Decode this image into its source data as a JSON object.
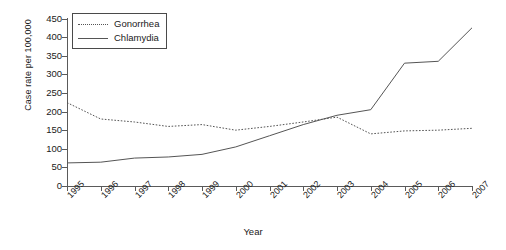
{
  "chart_data": {
    "type": "line",
    "title": "",
    "xlabel": "Year",
    "ylabel": "Case rate per 100,000",
    "x": [
      1995,
      1996,
      1997,
      1998,
      1999,
      2000,
      2001,
      2002,
      2003,
      2004,
      2005,
      2006,
      2007
    ],
    "categories": [
      "1995",
      "1996",
      "1997",
      "1998",
      "1999",
      "2000",
      "2001",
      "2002",
      "2003",
      "2004",
      "2005",
      "2006",
      "2007"
    ],
    "xlim": [
      1995,
      2007
    ],
    "ylim": [
      0,
      450
    ],
    "yticks": [
      0,
      50,
      100,
      150,
      200,
      250,
      300,
      350,
      400,
      450
    ],
    "grid": false,
    "legend_position": "top-left",
    "series": [
      {
        "name": "Gonorrhea",
        "style": "dotted",
        "color": "#555555",
        "values": [
          224,
          180,
          172,
          160,
          165,
          150,
          160,
          172,
          185,
          140,
          148,
          150,
          155
        ]
      },
      {
        "name": "Chlamydia",
        "style": "solid",
        "color": "#555555",
        "values": [
          62,
          64,
          75,
          78,
          85,
          105,
          135,
          165,
          190,
          205,
          330,
          335,
          425
        ]
      }
    ]
  },
  "legend": {
    "items": [
      {
        "label": "Gonorrhea",
        "key": "dotted-line-key"
      },
      {
        "label": "Chlamydia",
        "key": "solid-line-key"
      }
    ]
  },
  "axes": {
    "y_title": "Case rate per 100,000",
    "x_title": "Year",
    "y_tick_labels": [
      "450",
      "400",
      "350",
      "300",
      "250",
      "200",
      "150",
      "100",
      "50",
      "0"
    ],
    "x_tick_labels": [
      "1995",
      "1996",
      "1997",
      "1998",
      "1999",
      "2000",
      "2001",
      "2002",
      "2003",
      "2004",
      "2005",
      "2006",
      "2007"
    ]
  }
}
